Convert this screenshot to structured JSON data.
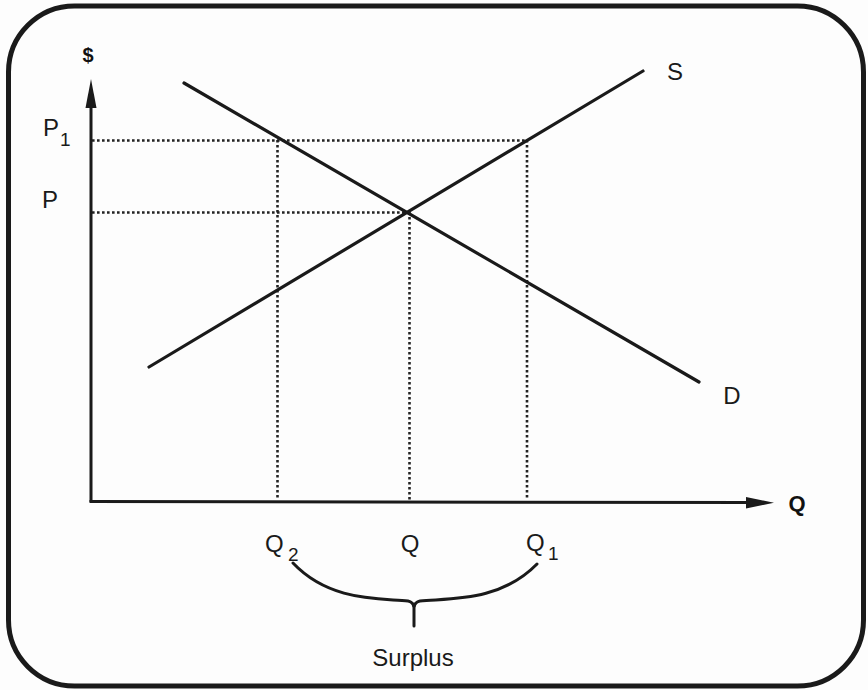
{
  "diagram": {
    "axes": {
      "y_label": "$",
      "x_label": "Q"
    },
    "curves": {
      "supply_label": "S",
      "demand_label": "D"
    },
    "price_labels": {
      "p1_main": "P",
      "p1_sub": "1",
      "p_main": "P"
    },
    "quantity_labels": {
      "q2_main": "Q",
      "q2_sub": "2",
      "q_main": "Q",
      "q1_main": "Q",
      "q1_sub": "1"
    },
    "brace_label": "Surplus"
  },
  "colors": {
    "ink": "#1a1a1a",
    "background": "#fdfdfd"
  }
}
